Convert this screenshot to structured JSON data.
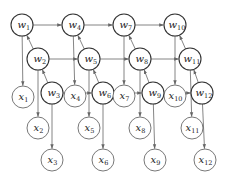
{
  "diagram": {
    "title": "",
    "colors": {
      "stroke_w": "#333333",
      "stroke_x": "#555555",
      "edge": "#666666",
      "text": "#222222",
      "background": "#ffffff"
    },
    "node_radius": 11,
    "nodes": [
      {
        "id": "w1",
        "base": "w",
        "sub": "1",
        "x": 22,
        "y": 25
      },
      {
        "id": "w2",
        "base": "w",
        "sub": "2",
        "x": 38,
        "y": 59
      },
      {
        "id": "w3",
        "base": "w",
        "sub": "3",
        "x": 52,
        "y": 93
      },
      {
        "id": "x1",
        "base": "x",
        "sub": "1",
        "x": 23,
        "y": 97
      },
      {
        "id": "x2",
        "base": "x",
        "sub": "2",
        "x": 38,
        "y": 128
      },
      {
        "id": "x3",
        "base": "x",
        "sub": "3",
        "x": 52,
        "y": 160
      },
      {
        "id": "w4",
        "base": "w",
        "sub": "4",
        "x": 73,
        "y": 25
      },
      {
        "id": "w5",
        "base": "w",
        "sub": "5",
        "x": 89,
        "y": 59
      },
      {
        "id": "w6",
        "base": "w",
        "sub": "6",
        "x": 103,
        "y": 93
      },
      {
        "id": "x4",
        "base": "x",
        "sub": "4",
        "x": 75,
        "y": 96
      },
      {
        "id": "x5",
        "base": "x",
        "sub": "5",
        "x": 89,
        "y": 128
      },
      {
        "id": "x6",
        "base": "x",
        "sub": "6",
        "x": 103,
        "y": 160
      },
      {
        "id": "w7",
        "base": "w",
        "sub": "7",
        "x": 124,
        "y": 25
      },
      {
        "id": "w8",
        "base": "w",
        "sub": "8",
        "x": 140,
        "y": 59
      },
      {
        "id": "w9",
        "base": "w",
        "sub": "9",
        "x": 153,
        "y": 93
      },
      {
        "id": "x7",
        "base": "x",
        "sub": "7",
        "x": 124,
        "y": 96
      },
      {
        "id": "x8",
        "base": "x",
        "sub": "8",
        "x": 140,
        "y": 128
      },
      {
        "id": "x9",
        "base": "x",
        "sub": "9",
        "x": 155,
        "y": 160
      },
      {
        "id": "w10",
        "base": "w",
        "sub": "10",
        "x": 175,
        "y": 25
      },
      {
        "id": "w11",
        "base": "w",
        "sub": "11",
        "x": 190,
        "y": 59
      },
      {
        "id": "w12",
        "base": "w",
        "sub": "12",
        "x": 202,
        "y": 93
      },
      {
        "id": "x10",
        "base": "x",
        "sub": "10",
        "x": 175,
        "y": 96
      },
      {
        "id": "x11",
        "base": "x",
        "sub": "11",
        "x": 192,
        "y": 128
      },
      {
        "id": "x12",
        "base": "x",
        "sub": "12",
        "x": 205,
        "y": 160
      }
    ],
    "edges": [
      {
        "from": "w1",
        "to": "w4"
      },
      {
        "from": "w4",
        "to": "w7"
      },
      {
        "from": "w7",
        "to": "w10"
      },
      {
        "from": "w2",
        "to": "w5"
      },
      {
        "from": "w5",
        "to": "w8"
      },
      {
        "from": "w8",
        "to": "w11"
      },
      {
        "from": "w3",
        "to": "w6"
      },
      {
        "from": "w6",
        "to": "w9"
      },
      {
        "from": "w9",
        "to": "w12"
      },
      {
        "from": "w2",
        "to": "w1"
      },
      {
        "from": "w3",
        "to": "w2"
      },
      {
        "from": "w5",
        "to": "w4"
      },
      {
        "from": "w6",
        "to": "w5"
      },
      {
        "from": "w8",
        "to": "w7"
      },
      {
        "from": "w9",
        "to": "w8"
      },
      {
        "from": "w11",
        "to": "w10"
      },
      {
        "from": "w12",
        "to": "w11"
      },
      {
        "from": "w1",
        "to": "x1"
      },
      {
        "from": "w2",
        "to": "x2"
      },
      {
        "from": "w3",
        "to": "x3"
      },
      {
        "from": "w4",
        "to": "x4"
      },
      {
        "from": "w5",
        "to": "x5"
      },
      {
        "from": "w6",
        "to": "x6"
      },
      {
        "from": "w7",
        "to": "x7"
      },
      {
        "from": "w8",
        "to": "x8"
      },
      {
        "from": "w9",
        "to": "x9"
      },
      {
        "from": "w10",
        "to": "x10"
      },
      {
        "from": "w11",
        "to": "x11"
      },
      {
        "from": "w12",
        "to": "x12"
      }
    ]
  }
}
